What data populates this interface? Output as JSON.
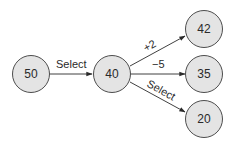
{
  "diagram": {
    "type": "state-transition",
    "nodes": [
      {
        "id": "n50",
        "label": "50"
      },
      {
        "id": "n40",
        "label": "40"
      },
      {
        "id": "n42",
        "label": "42"
      },
      {
        "id": "n35",
        "label": "35"
      },
      {
        "id": "n20",
        "label": "20"
      }
    ],
    "edges": [
      {
        "from": "n50",
        "to": "n40",
        "label": "Select"
      },
      {
        "from": "n40",
        "to": "n42",
        "label": "+2"
      },
      {
        "from": "n40",
        "to": "n35",
        "label": "−5"
      },
      {
        "from": "n40",
        "to": "n20",
        "label": "Select"
      }
    ],
    "colors": {
      "node_fill": "#e4e4e4",
      "node_stroke": "#3a3a3a",
      "edge": "#2a2a2a"
    }
  }
}
